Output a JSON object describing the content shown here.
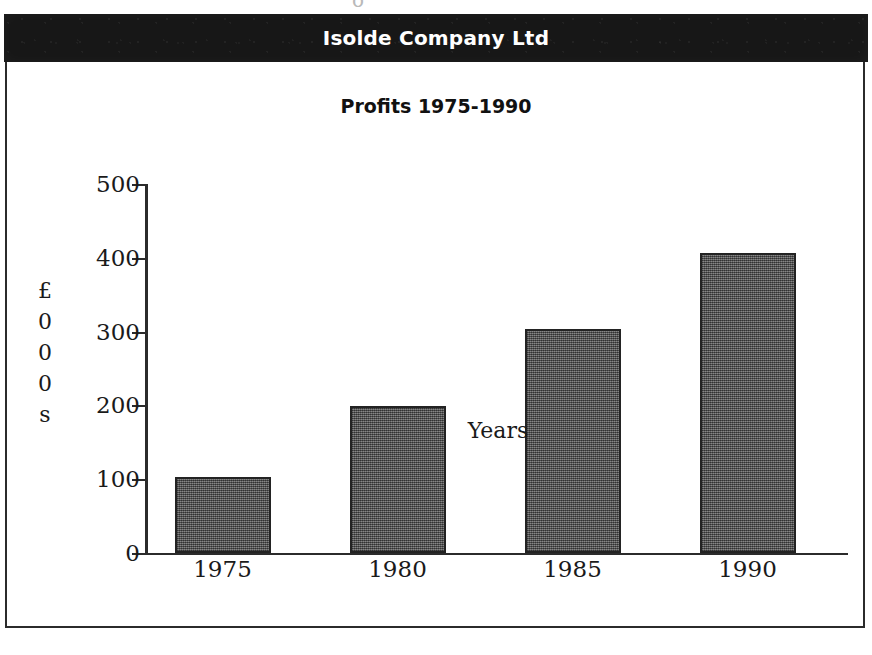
{
  "document": {
    "company_header": "Isolde Company Ltd",
    "scan_artifact": "o"
  },
  "chart_data": {
    "type": "bar",
    "title": "Profits 1975-1990",
    "categories": [
      "1975",
      "1980",
      "1985",
      "1990"
    ],
    "values": [
      103,
      199,
      303,
      406
    ],
    "xlabel": "Years",
    "ylabel_stacked": [
      "£",
      "0",
      "0",
      "0",
      "s"
    ],
    "ylabel": "£000s",
    "ylim": [
      0,
      500
    ],
    "ytick_labels": [
      "0",
      "100",
      "200",
      "300",
      "400",
      "500"
    ],
    "ytick_values": [
      0,
      100,
      200,
      300,
      400,
      500
    ],
    "grid": false,
    "legend": false,
    "bar_fill_color": "#5b5b5b",
    "bar_edge_color": "#232323",
    "axis_color": "#2b2b2b",
    "header_background": "#171717",
    "header_text_color": "#ffffff"
  }
}
